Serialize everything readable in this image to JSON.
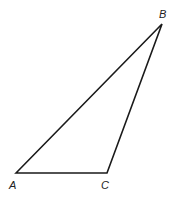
{
  "diagram": {
    "type": "triangle",
    "stroke_color": "#1a1a1a",
    "vertices": [
      {
        "label": "A",
        "x": 16,
        "y": 173
      },
      {
        "label": "B",
        "x": 162,
        "y": 24
      },
      {
        "label": "C",
        "x": 107,
        "y": 173
      }
    ],
    "edges": [
      [
        "A",
        "B"
      ],
      [
        "B",
        "C"
      ],
      [
        "C",
        "A"
      ]
    ]
  }
}
